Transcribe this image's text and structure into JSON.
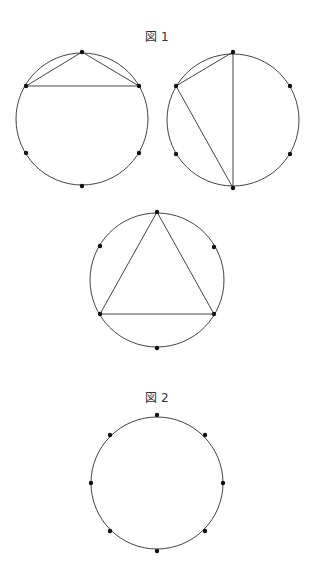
{
  "figure1": {
    "label": "図 1",
    "label_pos": [
      157,
      41
    ],
    "circles": [
      {
        "id": "fig1-circle-a",
        "center": [
          82,
          119
        ],
        "radius": 66,
        "points": [
          [
            82,
            52
          ],
          [
            26,
            86
          ],
          [
            139,
            86
          ],
          [
            26,
            153
          ],
          [
            139,
            153
          ],
          [
            82,
            186
          ]
        ],
        "chords": [
          [
            [
              82,
              52
            ],
            [
              26,
              86
            ]
          ],
          [
            [
              82,
              52
            ],
            [
              139,
              86
            ]
          ],
          [
            [
              26,
              86
            ],
            [
              139,
              86
            ]
          ]
        ]
      },
      {
        "id": "fig1-circle-b",
        "center": [
          233,
          120
        ],
        "radius": 66,
        "points": [
          [
            233,
            52
          ],
          [
            176,
            86
          ],
          [
            290,
            86
          ],
          [
            176,
            154
          ],
          [
            290,
            154
          ],
          [
            233,
            188
          ]
        ],
        "chords": [
          [
            [
              233,
              52
            ],
            [
              176,
              86
            ]
          ],
          [
            [
              233,
              52
            ],
            [
              233,
              188
            ]
          ],
          [
            [
              176,
              86
            ],
            [
              233,
              188
            ]
          ]
        ]
      },
      {
        "id": "fig1-circle-c",
        "center": [
          157,
          280
        ],
        "radius": 67,
        "points": [
          [
            157,
            212
          ],
          [
            100,
            246
          ],
          [
            214,
            247
          ],
          [
            100,
            314
          ],
          [
            214,
            314
          ],
          [
            157,
            348
          ]
        ],
        "chords": [
          [
            [
              157,
              212
            ],
            [
              100,
              314
            ]
          ],
          [
            [
              157,
              212
            ],
            [
              214,
              314
            ]
          ],
          [
            [
              100,
              314
            ],
            [
              214,
              314
            ]
          ]
        ]
      }
    ]
  },
  "figure2": {
    "label": "図 2",
    "label_pos": [
      157,
      402
    ],
    "circles": [
      {
        "id": "fig2-circle",
        "center": [
          157,
          483
        ],
        "radius": 66,
        "points": [
          [
            157,
            415
          ],
          [
            205,
            435
          ],
          [
            223,
            483
          ],
          [
            205,
            531
          ],
          [
            157,
            551
          ],
          [
            110,
            531
          ],
          [
            91,
            483
          ],
          [
            110,
            435
          ]
        ],
        "chords": []
      }
    ]
  }
}
